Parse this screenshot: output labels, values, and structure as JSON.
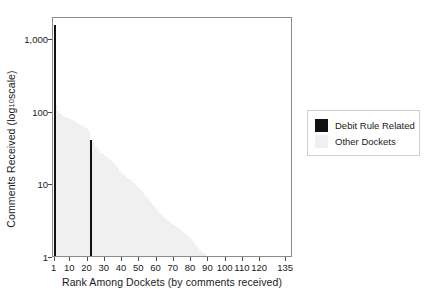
{
  "chart_data": {
    "type": "bar",
    "title": "",
    "subtitle": "",
    "xlabel": "Rank Among Dockets (by comments received)",
    "ylabel": "Comments Received (log10 scale)",
    "ylabel_prefix": "Comments Received (log",
    "ylabel_sub": "10",
    "ylabel_suffix": " scale)",
    "yscale": "log10",
    "ylim": [
      1,
      2000
    ],
    "xlim": [
      0,
      139
    ],
    "grid": false,
    "legend_position": "right",
    "ytick_labels": [
      "1,000",
      "100",
      "10",
      "1"
    ],
    "ytick_values": [
      1000,
      100,
      10,
      1
    ],
    "xtick_labels": [
      "1",
      "10",
      "20",
      "30",
      "40",
      "50",
      "60",
      "70",
      "80",
      "90",
      "100",
      "110",
      "120",
      "135"
    ],
    "xtick_values": [
      1,
      10,
      20,
      30,
      40,
      50,
      60,
      70,
      80,
      90,
      100,
      110,
      120,
      135
    ],
    "legend": [
      {
        "label": "Debit Rule Related",
        "color": "#111111"
      },
      {
        "label": "Other Dockets",
        "color": "#f0f0f0"
      }
    ],
    "series": [
      {
        "name": "Other Dockets",
        "color": "#f0f0f0",
        "x": [
          2,
          3,
          4,
          5,
          6,
          7,
          8,
          9,
          10,
          11,
          12,
          13,
          14,
          15,
          16,
          17,
          18,
          19,
          20,
          21,
          23,
          24,
          25,
          26,
          27,
          28,
          29,
          30,
          31,
          32,
          33,
          34,
          35,
          36,
          37,
          38,
          39,
          40,
          41,
          42,
          43,
          44,
          45,
          46,
          47,
          48,
          49,
          50,
          51,
          52,
          53,
          54,
          55,
          56,
          57,
          58,
          59,
          60,
          61,
          62,
          63,
          64,
          65,
          66,
          67,
          68,
          69,
          70,
          71,
          72,
          73,
          74,
          75,
          76,
          77,
          78,
          79,
          80,
          81,
          82,
          83,
          84,
          85,
          86,
          87,
          88
        ],
        "values": [
          118,
          100,
          92,
          88,
          85,
          82,
          80,
          78,
          76,
          74,
          72,
          70,
          68,
          66,
          64,
          62,
          60,
          57,
          55,
          52,
          38,
          35,
          32,
          30,
          28,
          26,
          25,
          24,
          23,
          22,
          21,
          20,
          19,
          18,
          17,
          16,
          15,
          14,
          13,
          12.5,
          12,
          11.5,
          11,
          10.5,
          10,
          9.5,
          9,
          8.5,
          8,
          7.5,
          7,
          6.6,
          6.2,
          5.8,
          5.4,
          5,
          4.7,
          4.4,
          4.1,
          3.9,
          3.7,
          3.5,
          3.3,
          3.1,
          3,
          2.9,
          2.8,
          2.7,
          2.6,
          2.5,
          2.4,
          2.3,
          2.2,
          2.1,
          2,
          1.9,
          1.8,
          1.7,
          1.6,
          1.5,
          1.4,
          1.3,
          1.2,
          1.15,
          1.1,
          1.05
        ]
      },
      {
        "name": "Debit Rule Related",
        "color": "#111111",
        "x": [
          1,
          22
        ],
        "values": [
          1500,
          40
        ]
      }
    ]
  }
}
